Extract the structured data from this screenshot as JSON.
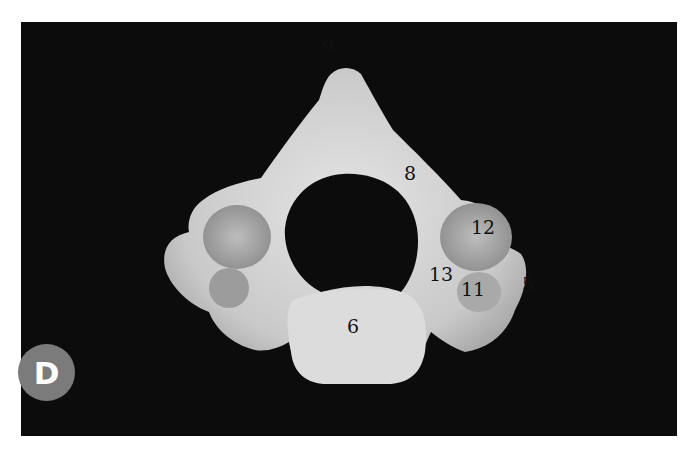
{
  "figure": {
    "panel_letter": "D",
    "badge_color": "#7b7b7b",
    "background_color": "#0c0c0c",
    "labels": [
      {
        "id": "9",
        "text": "9",
        "x": 322,
        "y": 37
      },
      {
        "id": "8",
        "text": "8",
        "x": 384,
        "y": 142
      },
      {
        "id": "12",
        "text": "12",
        "x": 449,
        "y": 196
      },
      {
        "id": "13",
        "text": "13",
        "x": 408,
        "y": 243
      },
      {
        "id": "11",
        "text": "11",
        "x": 439,
        "y": 257
      },
      {
        "id": "5",
        "text": "5",
        "x": 502,
        "y": 253
      },
      {
        "id": "6",
        "text": "6",
        "x": 326,
        "y": 296
      }
    ]
  }
}
